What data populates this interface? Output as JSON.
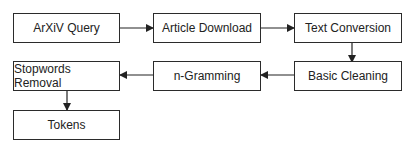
{
  "diagram": {
    "type": "flowchart",
    "nodes": [
      {
        "id": "arxiv_query",
        "label": "ArXiV Query"
      },
      {
        "id": "article_download",
        "label": "Article Download"
      },
      {
        "id": "text_conversion",
        "label": "Text Conversion"
      },
      {
        "id": "basic_cleaning",
        "label": "Basic Cleaning"
      },
      {
        "id": "n_gramming",
        "label": "n-Gramming"
      },
      {
        "id": "stopwords_removal",
        "label": "Stopwords Removal"
      },
      {
        "id": "tokens",
        "label": "Tokens"
      }
    ],
    "edges": [
      [
        "arxiv_query",
        "article_download"
      ],
      [
        "article_download",
        "text_conversion"
      ],
      [
        "text_conversion",
        "basic_cleaning"
      ],
      [
        "basic_cleaning",
        "n_gramming"
      ],
      [
        "n_gramming",
        "stopwords_removal"
      ],
      [
        "stopwords_removal",
        "tokens"
      ]
    ]
  }
}
